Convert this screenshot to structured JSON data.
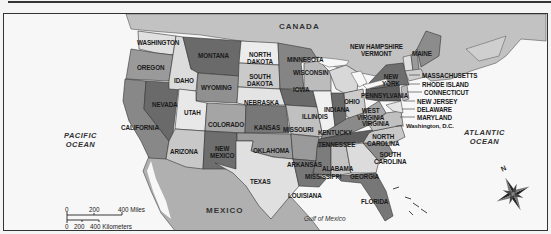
{
  "map": {
    "title": "United States political map",
    "countries": {
      "canada": "CANADA",
      "mexico": "MEXICO"
    },
    "water": {
      "pacific": [
        "PACIFIC",
        "OCEAN"
      ],
      "atlantic": [
        "ATLANTIC",
        "OCEAN"
      ],
      "gulf": "Gulf of Mexico"
    },
    "states": {
      "washington": "WASHINGTON",
      "oregon": "OREGON",
      "california": "CALIFORNIA",
      "nevada": "NEVADA",
      "idaho": "IDAHO",
      "montana": "MONTANA",
      "wyoming": "WYOMING",
      "utah": "UTAH",
      "arizona": "ARIZONA",
      "colorado": "COLORADO",
      "new_mexico": [
        "NEW",
        "MEXICO"
      ],
      "north_dakota": [
        "NORTH",
        "DAKOTA"
      ],
      "south_dakota": [
        "SOUTH",
        "DAKOTA"
      ],
      "nebraska": "NEBRASKA",
      "kansas": "KANSAS",
      "oklahoma": "OKLAHOMA",
      "texas": "TEXAS",
      "minnesota": "MINNESOTA",
      "iowa": "IOWA",
      "missouri": "MISSOURI",
      "arkansas": "ARKANSAS",
      "louisiana": "LOUISIANA",
      "wisconsin": "WISCONSIN",
      "illinois": "ILLINOIS",
      "indiana": "INDIANA",
      "ohio": "OHIO",
      "kentucky": "KENTUCKY",
      "tennessee": "TENNESSEE",
      "mississippi": "MISSISSIPPI",
      "alabama": "ALABAMA",
      "georgia": "GEORGIA",
      "florida": "FLORIDA",
      "south_carolina": [
        "SOUTH",
        "CAROLINA"
      ],
      "north_carolina": [
        "NORTH",
        "CAROLINA"
      ],
      "virginia": "VIRGINIA",
      "west_virginia": [
        "WEST",
        "VIRGINIA"
      ],
      "pennsylvania": "PENNSYLVANIA",
      "new_york": [
        "NEW",
        "YORK"
      ],
      "vermont": "VERMONT",
      "new_hampshire": "NEW HAMPSHIRE",
      "maine": "MAINE",
      "massachusetts": "MASSACHUSETTS",
      "rhode_island": "RHODE ISLAND",
      "connecticut": "CONNECTICUT",
      "new_jersey": "NEW JERSEY",
      "delaware": "DELAWARE",
      "maryland": "MARYLAND",
      "dc": "Washington, D.C."
    },
    "scale": {
      "miles_ticks": [
        "0",
        "200",
        "400 Miles"
      ],
      "km_ticks": [
        "0",
        "200",
        "400 Kilometers"
      ]
    },
    "compass": {
      "north_label": "N"
    },
    "colors": {
      "background": "#f7f7f7",
      "land_foreign": "#b8b8b8",
      "state_light": "#dcdcdc",
      "state_mid": "#a8a8a8",
      "state_dark": "#6e6e6e",
      "border": "#333333"
    }
  }
}
